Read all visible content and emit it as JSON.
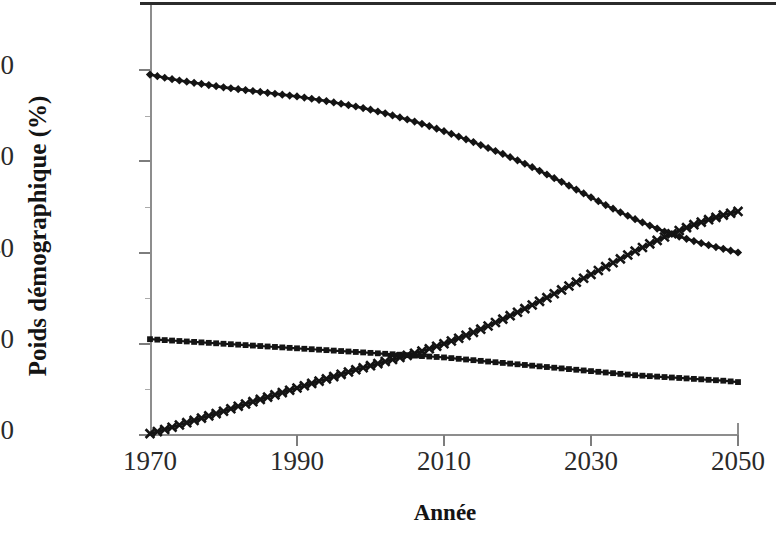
{
  "chart_data": {
    "type": "line",
    "title": "",
    "xlabel": "Année",
    "ylabel": "Poids démographique (%)",
    "xlim": [
      1970,
      2050
    ],
    "ylim": [
      0,
      88
    ],
    "grid": false,
    "legend": "none",
    "xticks": [
      "1970",
      "1990",
      "2010",
      "2030",
      "2050"
    ],
    "xtick_values": [
      1970,
      1990,
      2010,
      2030,
      2050
    ],
    "yticks": [
      "0",
      "20",
      "40",
      "60",
      "80"
    ],
    "ytick_values": [
      0,
      20,
      40,
      60,
      80
    ],
    "x": [
      1970,
      1972,
      1974,
      1976,
      1978,
      1980,
      1982,
      1984,
      1986,
      1988,
      1990,
      1992,
      1994,
      1996,
      1998,
      2000,
      2002,
      2004,
      2006,
      2008,
      2010,
      2012,
      2014,
      2016,
      2018,
      2020,
      2022,
      2024,
      2026,
      2028,
      2030,
      2032,
      2034,
      2036,
      2038,
      2040,
      2042,
      2044,
      2046,
      2048,
      2050
    ],
    "series": [
      {
        "name": "serie-losange",
        "marker": "diamond",
        "values": [
          79.0,
          78.3,
          77.7,
          77.2,
          76.7,
          76.2,
          75.8,
          75.4,
          75.0,
          74.6,
          74.2,
          73.7,
          73.2,
          72.6,
          72.0,
          71.3,
          70.5,
          69.6,
          68.7,
          67.7,
          66.6,
          65.4,
          64.2,
          62.9,
          61.6,
          60.2,
          58.7,
          57.1,
          55.5,
          53.8,
          52.1,
          50.4,
          48.8,
          47.3,
          45.9,
          44.6,
          43.5,
          42.5,
          41.6,
          40.8,
          40.0
        ]
      },
      {
        "name": "serie-croix",
        "marker": "x",
        "values": [
          0.3,
          1.2,
          2.2,
          3.2,
          4.2,
          5.2,
          6.3,
          7.3,
          8.3,
          9.3,
          10.3,
          11.3,
          12.3,
          13.3,
          14.3,
          15.2,
          16.1,
          17.0,
          17.9,
          18.9,
          20.0,
          21.2,
          22.5,
          23.9,
          25.4,
          26.9,
          28.5,
          30.1,
          31.8,
          33.5,
          35.2,
          36.9,
          38.6,
          40.3,
          41.9,
          43.4,
          44.8,
          46.1,
          47.2,
          48.2,
          49.0
        ]
      },
      {
        "name": "serie-carre",
        "marker": "square",
        "values": [
          21.0,
          20.8,
          20.6,
          20.4,
          20.2,
          20.0,
          19.8,
          19.6,
          19.4,
          19.2,
          19.0,
          18.8,
          18.6,
          18.4,
          18.2,
          18.0,
          17.8,
          17.6,
          17.4,
          17.2,
          17.0,
          16.7,
          16.4,
          16.1,
          15.8,
          15.5,
          15.2,
          14.9,
          14.6,
          14.3,
          14.0,
          13.7,
          13.4,
          13.1,
          12.9,
          12.7,
          12.5,
          12.3,
          12.1,
          11.9,
          11.6
        ]
      }
    ]
  },
  "axis": {
    "y_title": "Poids démographique (%)",
    "x_title": "Année"
  }
}
